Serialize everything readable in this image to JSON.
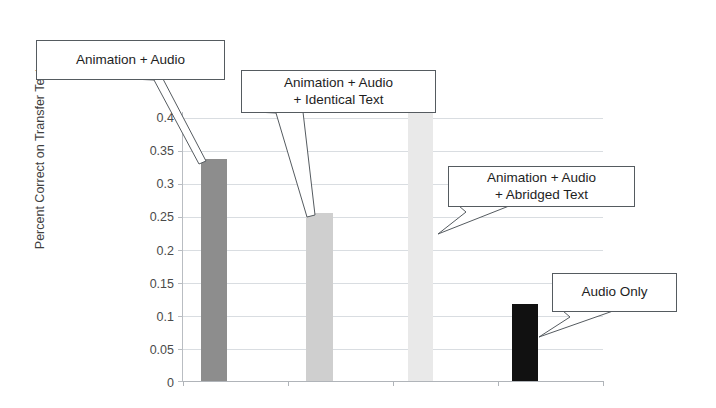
{
  "chart_data": {
    "type": "bar",
    "title": "",
    "xlabel": "",
    "ylabel": "Percent Correct on Transfer Test",
    "ylim": [
      0,
      0.4
    ],
    "ytick_labels": [
      "0.4",
      "0.35",
      "0.3",
      "0.25",
      "0.2",
      "0.15",
      "0.1",
      "0.05",
      "0"
    ],
    "ytick_values": [
      0.4,
      0.35,
      0.3,
      0.25,
      0.2,
      0.15,
      0.1,
      0.05,
      0
    ],
    "grid": true,
    "legend": "none",
    "xtick_labels": [
      "",
      "",
      "",
      ""
    ],
    "categories": [
      "Animation + Audio",
      "Animation + Audio + Identical Text",
      "Animation + Audio + Abridged Text",
      "Audio Only"
    ],
    "values": [
      0.33,
      0.25,
      0.4,
      0.115
    ],
    "bar_colors": [
      "#8d8d8d",
      "#cfcfcf",
      "#e9e9e9",
      "#111111"
    ],
    "annotations": [
      {
        "id": "callout-animation-audio",
        "lines": [
          "Animation + Audio"
        ],
        "points_to_category": "Animation + Audio",
        "points_to_value": 0.33
      },
      {
        "id": "callout-animation-audio-identical-text",
        "lines": [
          "Animation + Audio",
          "+ Identical Text"
        ],
        "points_to_category": "Animation + Audio + Identical Text",
        "points_to_value": 0.25
      },
      {
        "id": "callout-animation-audio-abridged-text",
        "lines": [
          "Animation + Audio",
          "+ Abridged Text"
        ],
        "points_to_category": "Animation + Audio + Abridged Text",
        "points_to_value": 0.4
      },
      {
        "id": "callout-audio-only",
        "lines": [
          "Audio Only"
        ],
        "points_to_category": "Audio Only",
        "points_to_value": 0.115
      }
    ]
  },
  "axis": {
    "y": {
      "t0": "0.4",
      "t1": "0.35",
      "t2": "0.3",
      "t3": "0.25",
      "t4": "0.2",
      "t5": "0.15",
      "t6": "0.1",
      "t7": "0.05",
      "t8": "0",
      "title": "Percent Correct on Transfer Test"
    }
  },
  "callouts": {
    "c1": {
      "line1": "Animation + Audio"
    },
    "c2": {
      "line1": "Animation + Audio",
      "line2": "+ Identical Text"
    },
    "c3": {
      "line1": "Animation + Audio",
      "line2": "+ Abridged Text"
    },
    "c4": {
      "line1": "Audio Only"
    }
  }
}
